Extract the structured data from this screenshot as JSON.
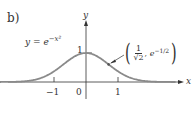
{
  "panel_label": "b)",
  "equation": {
    "lhs": "y",
    "eq": "=",
    "base": "e",
    "exponent": "−x²"
  },
  "annotation": {
    "numerator": "1",
    "denominator": "√2",
    "second": "e",
    "second_exp": "−1/2"
  },
  "axis": {
    "x_label": "x",
    "y_label": "y"
  },
  "ticks": {
    "neg1": "−1",
    "zero": "0",
    "pos1": "1",
    "y1": "1"
  },
  "colors": {
    "curve": "#8a8a8a",
    "axis": "#333333",
    "text": "#333333"
  },
  "chart_data": {
    "type": "line",
    "xlabel": "x",
    "ylabel": "y",
    "x": [
      -2.5,
      -2,
      -1.5,
      -1,
      -0.5,
      0,
      0.5,
      1,
      1.5,
      2,
      2.5
    ],
    "series": [
      {
        "name": "y = e^(-x^2)",
        "values": [
          0.002,
          0.018,
          0.105,
          0.368,
          0.779,
          1.0,
          0.779,
          0.368,
          0.105,
          0.018,
          0.002
        ]
      }
    ],
    "x_ticks": [
      "-1",
      "0",
      "1"
    ],
    "y_ticks": [
      "1"
    ],
    "annotations": [
      {
        "text": "(1/√2, e^(-1/2))",
        "x": 0.707,
        "y": 0.607
      }
    ],
    "xlim": [
      -2.7,
      2.8
    ],
    "ylim": [
      0,
      1.3
    ],
    "grid": false,
    "legend": "none"
  }
}
